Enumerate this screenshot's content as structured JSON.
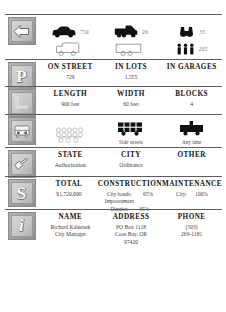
{
  "document": {
    "type": "transportation-fact-sheet"
  },
  "rows": [
    {
      "icon": "left-arrow-icon",
      "glyph": "⇦",
      "kind": "pictogram",
      "pictograms": [
        {
          "name": "car-filled-icon",
          "value": "750"
        },
        {
          "name": "truck-filled-icon",
          "value": "26"
        },
        {
          "name": "binoculars-filled-icon",
          "value": "35"
        }
      ],
      "pictograms_row2": [
        {
          "name": "car-outline-icon",
          "value": ""
        },
        {
          "name": "truck-outline-icon",
          "value": ""
        },
        {
          "name": "people-filled-icon",
          "value": "205"
        }
      ]
    },
    {
      "icon": "parking-p-icon",
      "glyph": "P",
      "kind": "grid3",
      "columns": [
        {
          "header": "ON STREET",
          "value": "729"
        },
        {
          "header": "IN LOTS",
          "value": "1,555"
        },
        {
          "header": "IN GARAGES",
          "value": ""
        }
      ]
    },
    {
      "icon": "ruler-corner-icon",
      "glyph": "L",
      "kind": "grid3",
      "columns": [
        {
          "header": "LENGTH",
          "value": "900 feet"
        },
        {
          "header": "WIDTH",
          "value": "60 feet"
        },
        {
          "header": "BLOCKS",
          "value": "4"
        }
      ]
    },
    {
      "icon": "bus-front-icon",
      "glyph": "B",
      "kind": "pictogram-captioned",
      "slots": [
        {
          "name": "crowd-outline-icon",
          "caption": ""
        },
        {
          "name": "bus-grid-icon",
          "caption": "Side streets"
        },
        {
          "name": "bus-stop-icon",
          "caption": "Any time"
        }
      ]
    },
    {
      "icon": "gavel-icon",
      "glyph": "G",
      "kind": "grid3",
      "columns": [
        {
          "header": "STATE",
          "value": "Authorization"
        },
        {
          "header": "CITY",
          "value": "Ordinance"
        },
        {
          "header": "OTHER",
          "value": ""
        }
      ]
    },
    {
      "icon": "dollar-sign-icon",
      "glyph": "S",
      "kind": "grid3-kv",
      "columns": [
        {
          "header": "TOTAL",
          "value": "$1,720,000",
          "pairs": []
        },
        {
          "header": "CONSTRUCTION",
          "value": "",
          "pairs": [
            {
              "k": "City bonds:",
              "v": "65%"
            },
            {
              "k": "Improvement",
              "v": ""
            },
            {
              "k": "District:",
              "v": "35%"
            }
          ]
        },
        {
          "header": "MAINTENANCE",
          "value": "",
          "pairs": [
            {
              "k": "City:",
              "v": "100%"
            }
          ]
        }
      ]
    },
    {
      "icon": "information-i-icon",
      "glyph": "i",
      "kind": "grid3-multiline",
      "columns": [
        {
          "header": "NAME",
          "lines": [
            "Richard Kaluzsek",
            "City Manager"
          ]
        },
        {
          "header": "ADDRESS",
          "lines": [
            "PO Box 1118",
            "Coos Bay, OR",
            "97420"
          ]
        },
        {
          "header": "PHONE",
          "lines": [
            "(503)",
            "269-1181"
          ]
        }
      ]
    }
  ],
  "colors": {
    "rule": "#5d5d5d",
    "header_text": "#141414",
    "value_text": "#3d3d3d",
    "pictogram_number": "#7a7a7a",
    "tile_face": "#c6c6c6",
    "tile_border": "#8a8a8a",
    "ink": "#111111"
  }
}
